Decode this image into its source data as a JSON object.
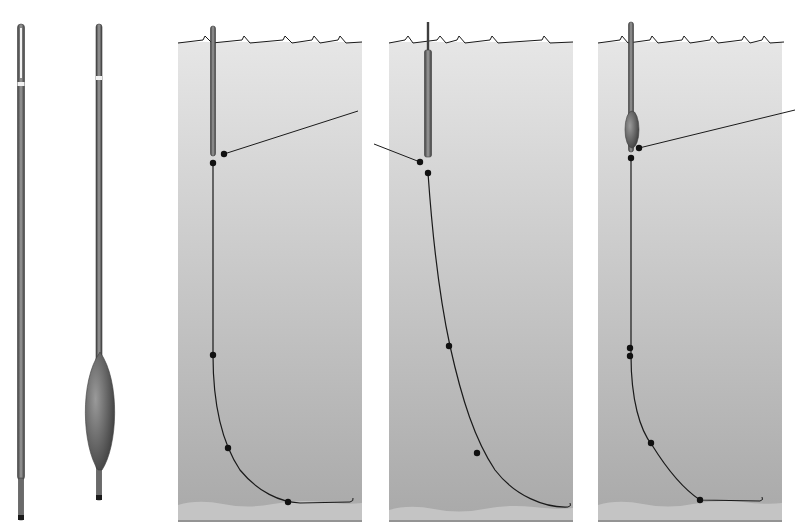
{
  "figure": {
    "width": 795,
    "height": 532,
    "colors": {
      "background": "#ffffff",
      "water_top": "#e6e6e6",
      "water_bottom": "#a9a9a9",
      "bed": "#c4c4c4",
      "bed_line": "#2a2a2a",
      "float_dark": "#3e3e3e",
      "float_mid": "#6a6a6a",
      "float_light": "#9a9a9a",
      "line": "#1a1a1a",
      "shot": "#111111",
      "band": "#f2f2f2"
    }
  },
  "floats": [
    {
      "id": "straight-waggler",
      "x": 21,
      "top": 24,
      "bottom": 520,
      "width": 7,
      "band_y": 82,
      "tip_light_top": 28,
      "tip_light_bottom": 78,
      "stem_y": 480,
      "stem_width": 5
    },
    {
      "id": "bodied-waggler",
      "x": 99,
      "top": 24,
      "bottom": 500,
      "width": 6,
      "band_y": 76,
      "body": {
        "cx": 100,
        "top": 352,
        "bottom": 470,
        "rx": 16
      },
      "stem_y": 470,
      "stem_width": 5
    }
  ],
  "panels": [
    {
      "id": "rig-1",
      "x": 178,
      "y": 42,
      "width": 184,
      "height": 478,
      "waves_y": 42,
      "waves": [
        [
          178,
          43
        ],
        [
          203,
          40
        ],
        [
          205,
          36
        ],
        [
          212,
          43
        ],
        [
          242,
          40
        ],
        [
          244,
          36
        ],
        [
          250,
          43
        ],
        [
          283,
          40
        ],
        [
          285,
          36
        ],
        [
          292,
          43
        ],
        [
          312,
          40
        ],
        [
          314,
          36
        ],
        [
          320,
          43
        ],
        [
          338,
          40
        ],
        [
          340,
          36
        ],
        [
          346,
          43
        ],
        [
          362,
          42
        ]
      ],
      "float": {
        "x": 213,
        "top": 26,
        "bottom": 156,
        "width": 5,
        "body": null
      },
      "main_line": [
        [
          224,
          154
        ],
        [
          358,
          111
        ]
      ],
      "main_line_shot": [
        224,
        154
      ],
      "hook_length": "M213,163 L213,355 C213,400 220,440 240,470 C258,492 280,502 300,503 L350,502",
      "hook_curl": "M350,502 q4,-1 3,-4",
      "shots": [
        [
          213,
          163
        ],
        [
          213,
          355
        ],
        [
          228,
          448
        ],
        [
          288,
          502
        ]
      ],
      "bed_y": 505
    },
    {
      "id": "rig-2",
      "x": 389,
      "y": 42,
      "width": 184,
      "height": 478,
      "waves_y": 42,
      "waves": [
        [
          389,
          43
        ],
        [
          405,
          40
        ],
        [
          408,
          36
        ],
        [
          413,
          43
        ],
        [
          437,
          40
        ],
        [
          440,
          36
        ],
        [
          446,
          43
        ],
        [
          457,
          40
        ],
        [
          459,
          36
        ],
        [
          465,
          43
        ],
        [
          490,
          40
        ],
        [
          492,
          36
        ],
        [
          498,
          43
        ],
        [
          542,
          40
        ],
        [
          544,
          36
        ],
        [
          550,
          43
        ],
        [
          573,
          42
        ]
      ],
      "float": {
        "x": 428,
        "top": 22,
        "bottom": 157,
        "width": 5,
        "body": null,
        "wide_from": 50,
        "wide_width": 7
      },
      "main_line": [
        [
          420,
          162
        ],
        [
          374,
          144
        ]
      ],
      "main_line_shot": [
        420,
        162
      ],
      "hook_length": "M428,173 C432,230 440,300 450,346 C462,400 475,440 495,470 C515,496 545,508 568,507",
      "hook_curl": "M568,507 q4,-1 2,-4",
      "shots": [
        [
          428,
          173
        ],
        [
          449,
          346
        ],
        [
          477,
          453
        ]
      ],
      "bed_y": 510
    },
    {
      "id": "rig-3",
      "x": 598,
      "y": 42,
      "width": 184,
      "height": 478,
      "waves_y": 42,
      "waves": [
        [
          598,
          43
        ],
        [
          620,
          40
        ],
        [
          622,
          36
        ],
        [
          628,
          43
        ],
        [
          650,
          40
        ],
        [
          652,
          36
        ],
        [
          658,
          43
        ],
        [
          682,
          40
        ],
        [
          684,
          36
        ],
        [
          690,
          43
        ],
        [
          710,
          40
        ],
        [
          712,
          36
        ],
        [
          718,
          43
        ],
        [
          742,
          40
        ],
        [
          744,
          36
        ],
        [
          750,
          43
        ],
        [
          762,
          40
        ],
        [
          764,
          36
        ],
        [
          770,
          43
        ],
        [
          784,
          42
        ]
      ],
      "float": {
        "x": 631,
        "top": 22,
        "bottom": 152,
        "width": 5,
        "body": {
          "cx": 632,
          "top": 111,
          "bottom": 148,
          "rx": 7
        }
      },
      "main_line": [
        [
          639,
          148
        ],
        [
          795,
          110
        ]
      ],
      "main_line_shot": [
        639,
        148
      ],
      "hook_length": "M631,158 L631,355 C631,400 640,430 652,445 C670,474 685,490 700,500 L760,501",
      "hook_curl": "M760,501 q4,-1 2,-4",
      "shots": [
        [
          631,
          158
        ],
        [
          630,
          348
        ],
        [
          630,
          356
        ],
        [
          651,
          443
        ],
        [
          700,
          500
        ]
      ],
      "bed_y": 505
    }
  ]
}
